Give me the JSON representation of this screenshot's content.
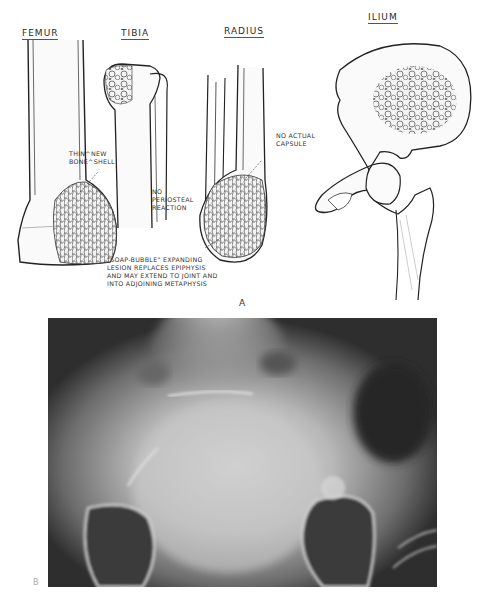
{
  "panel_a": {
    "letter": "A",
    "bone_labels": {
      "femur": "FEMUR",
      "tibia": "TIBIA",
      "radius": "RADIUS",
      "ilium": "ILIUM"
    },
    "annotations": {
      "femur_shell": "THIN^NEW\nBONE^SHELL",
      "tibia_periosteal": "NO\nPERIOSTEAL\nREACTION",
      "radius_capsule": "NO ACTUAL\nCAPSULE",
      "soap_bubble": "\"SOAP-BUBBLE\" EXPANDING\nLESION REPLACES EPIPHYSIS\nAND MAY EXTEND TO JOINT AND\nINTO ADJOINING METAPHYSIS"
    }
  },
  "panel_b": {
    "letter": "B",
    "description": "Pelvic radiograph"
  }
}
